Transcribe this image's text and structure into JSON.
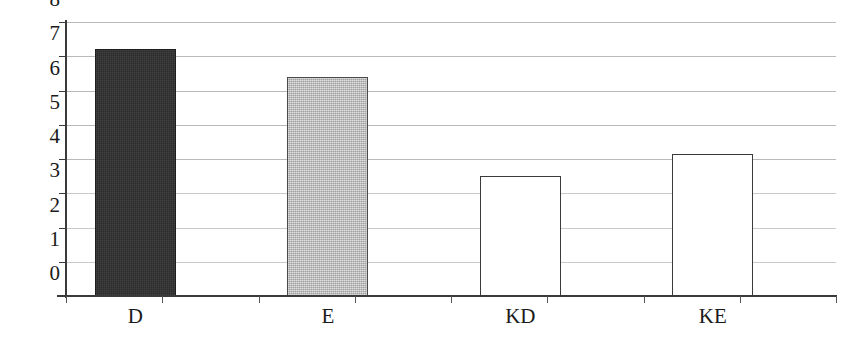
{
  "chart_data": {
    "type": "bar",
    "title": "",
    "subtitle": "",
    "xlabel": "",
    "ylabel": "",
    "categories": [
      "D",
      "E",
      "KD",
      "KE"
    ],
    "values": [
      7.2,
      6.4,
      3.5,
      4.15
    ],
    "series": [
      {
        "name": "",
        "values": [
          7.2,
          6.4,
          3.5,
          4.15
        ]
      }
    ],
    "ylim": [
      0,
      8
    ],
    "y_ticks": [
      0,
      1,
      2,
      3,
      4,
      5,
      6,
      7,
      8
    ],
    "y_tick_labels": [
      "0",
      "1",
      "2",
      "3",
      "4",
      "5",
      "6",
      "7",
      "8"
    ],
    "grid": true,
    "grid_axis": "y",
    "legend": false,
    "legend_position": "none",
    "annotations": [],
    "bar_styles": [
      {
        "category": "D",
        "fill": "#2b2b2b",
        "edge": "#1e1e1e",
        "style": "dark-dithered"
      },
      {
        "category": "E",
        "fill": "#b2b2b2",
        "edge": "#4a4a4a",
        "style": "gray-dithered"
      },
      {
        "category": "KD",
        "fill": "#ffffff",
        "edge": "#3a3a3a",
        "style": "outline-only"
      },
      {
        "category": "KE",
        "fill": "#ffffff",
        "edge": "#3a3a3a",
        "style": "outline-only"
      }
    ]
  },
  "axes": {
    "y_tick_labels": [
      "8",
      "7",
      "6",
      "5",
      "4",
      "3",
      "2",
      "1",
      "0"
    ],
    "x_tick_count": 9
  },
  "colors": {
    "background": "#ffffff",
    "axis": "#3a3a3a",
    "gridline": "#b9b9b9",
    "gridline_faint": "#c9c9c9",
    "text": "#1a1a1a",
    "bar_dark": "#2b2b2b",
    "bar_gray": "#b2b2b2",
    "bar_white": "#ffffff",
    "bar_outline": "#3a3a3a"
  }
}
